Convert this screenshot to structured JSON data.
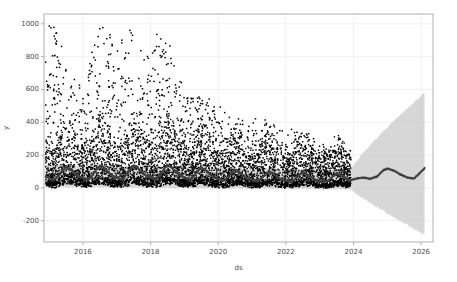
{
  "chart_data": {
    "type": "line",
    "title": "",
    "subtitle": "",
    "xlabel": "ds",
    "ylabel": "y",
    "grid": true,
    "legend": null,
    "xlim": [
      2014.85,
      2026.35
    ],
    "ylim": [
      -330,
      1060
    ],
    "xticks": [
      "2016",
      "2018",
      "2020",
      "2022",
      "2024",
      "2026"
    ],
    "xtick_values": [
      2016,
      2018,
      2020,
      2022,
      2024,
      2026
    ],
    "yticks": [
      "-200",
      "0",
      "200",
      "400",
      "600",
      "800",
      "1000"
    ],
    "ytick_values": [
      -200,
      0,
      200,
      400,
      600,
      800,
      1000
    ],
    "history_end": 2023.92,
    "forecast_end": 2026.1,
    "colors": {
      "observed_points": "#000000",
      "forecast_line": "#404040",
      "uncertainty_band": "#c9c9c9",
      "spine": "#b0b0b0",
      "grid": "#f0f0f0",
      "background": "#ffffff",
      "tick_text": "#4d4d4d"
    },
    "series": [
      {
        "name": "yhat",
        "kind": "line",
        "description": "Prophet forecast trend with yearly seasonality, declining level over time",
        "x": [
          2014.9,
          2015.0,
          2015.1,
          2015.2,
          2015.3,
          2015.4,
          2015.5,
          2015.6,
          2015.7,
          2015.8,
          2015.9,
          2016.0,
          2016.1,
          2016.2,
          2016.3,
          2016.4,
          2016.5,
          2016.6,
          2016.7,
          2016.8,
          2016.9,
          2017.0,
          2017.1,
          2017.2,
          2017.3,
          2017.4,
          2017.5,
          2017.6,
          2017.7,
          2017.8,
          2017.9,
          2018.0,
          2018.1,
          2018.2,
          2018.3,
          2018.4,
          2018.5,
          2018.6,
          2018.7,
          2018.8,
          2018.9,
          2019.0,
          2019.1,
          2019.2,
          2019.3,
          2019.4,
          2019.5,
          2019.6,
          2019.7,
          2019.8,
          2019.9,
          2020.0,
          2020.1,
          2020.2,
          2020.3,
          2020.4,
          2020.5,
          2020.6,
          2020.7,
          2020.8,
          2020.9,
          2021.0,
          2021.1,
          2021.2,
          2021.3,
          2021.4,
          2021.5,
          2021.6,
          2021.7,
          2021.8,
          2021.9,
          2022.0,
          2022.1,
          2022.2,
          2022.3,
          2022.4,
          2022.5,
          2022.6,
          2022.7,
          2022.8,
          2022.9,
          2023.0,
          2023.1,
          2023.2,
          2023.3,
          2023.4,
          2023.5,
          2023.6,
          2023.7,
          2023.8,
          2023.92,
          2024.1,
          2024.3,
          2024.5,
          2024.7,
          2024.9,
          2025.0,
          2025.2,
          2025.4,
          2025.6,
          2025.8,
          2026.1
        ],
        "y": [
          70,
          60,
          48,
          55,
          78,
          108,
          128,
          120,
          100,
          80,
          68,
          62,
          52,
          58,
          80,
          112,
          134,
          126,
          104,
          84,
          70,
          64,
          54,
          60,
          82,
          114,
          136,
          128,
          106,
          86,
          72,
          66,
          56,
          62,
          84,
          116,
          138,
          130,
          108,
          88,
          74,
          64,
          52,
          56,
          76,
          104,
          122,
          114,
          94,
          76,
          62,
          56,
          46,
          50,
          68,
          92,
          108,
          100,
          82,
          66,
          54,
          50,
          42,
          46,
          62,
          84,
          98,
          92,
          76,
          60,
          50,
          46,
          38,
          42,
          58,
          78,
          92,
          86,
          70,
          56,
          46,
          44,
          36,
          40,
          54,
          72,
          86,
          80,
          66,
          52,
          46,
          58,
          62,
          55,
          70,
          110,
          118,
          104,
          80,
          62,
          58,
          120
        ]
      },
      {
        "name": "yhat_upper",
        "kind": "band-upper",
        "description": "Upper bound of uncertainty interval, widens sharply in forecast region",
        "y_at_history_start": 140,
        "y_at_history_end": 110,
        "y_at_forecast_end": 580
      },
      {
        "name": "yhat_lower",
        "kind": "band-lower",
        "description": "Lower bound of uncertainty interval, widens sharply in forecast region",
        "y_at_history_start": 5,
        "y_at_history_end": -10,
        "y_at_forecast_end": -285
      },
      {
        "name": "observed",
        "kind": "scatter",
        "description": "Observed daily values as black dots; dense cloud 0-250 with heavy right-skewed outliers up to 1000 in early years, decaying amplitude after 2020",
        "n_points_approx": 3300,
        "y_max_observed": 1005,
        "y_min_observed": 0,
        "outlier_cap": 1000,
        "density_upper_envelope": [
          [
            2014.9,
            1005
          ],
          [
            2015.2,
            1005
          ],
          [
            2015.6,
            700
          ],
          [
            2016.0,
            600
          ],
          [
            2016.45,
            1000
          ],
          [
            2016.7,
            1000
          ],
          [
            2017.0,
            830
          ],
          [
            2017.4,
            1000
          ],
          [
            2017.75,
            915
          ],
          [
            2017.95,
            790
          ],
          [
            2018.3,
            1005
          ],
          [
            2018.5,
            935
          ],
          [
            2018.9,
            660
          ],
          [
            2019.3,
            560
          ],
          [
            2019.9,
            550
          ],
          [
            2020.3,
            440
          ],
          [
            2020.8,
            435
          ],
          [
            2021.3,
            420
          ],
          [
            2021.95,
            350
          ],
          [
            2022.75,
            325
          ],
          [
            2023.2,
            250
          ],
          [
            2023.9,
            215
          ]
        ]
      }
    ]
  }
}
